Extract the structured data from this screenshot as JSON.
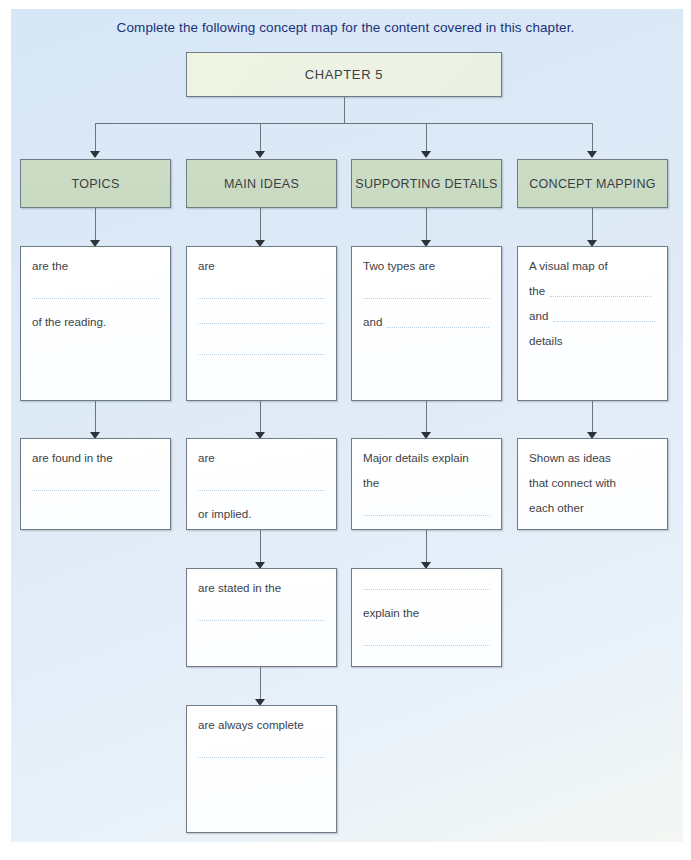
{
  "instruction": "Complete the following concept map for the content covered in this chapter.",
  "root": {
    "label": "CHAPTER 5"
  },
  "colors": {
    "page_background": "#dce9f6",
    "root_box": "#edf2e4",
    "header_box": "#c9dac3",
    "card_box": "#ffffff",
    "border": "#6f7c85",
    "instruction_text": "#20307a",
    "body_text": "#3c4147",
    "dotted_line": "#b9cfe2"
  },
  "columns": [
    {
      "header": "TOPICS",
      "cards": [
        {
          "lines": [
            {
              "type": "text",
              "text": "are the"
            },
            {
              "type": "blank"
            },
            {
              "type": "blank-line"
            },
            {
              "type": "text",
              "text": "of the reading."
            }
          ]
        },
        {
          "lines": [
            {
              "type": "text",
              "text": "are found in the"
            },
            {
              "type": "blank"
            },
            {
              "type": "blank-line"
            }
          ]
        }
      ]
    },
    {
      "header": "MAIN IDEAS",
      "cards": [
        {
          "lines": [
            {
              "type": "text",
              "text": "are"
            },
            {
              "type": "blank"
            },
            {
              "type": "blank-line"
            },
            {
              "type": "blank-line"
            },
            {
              "type": "blank"
            },
            {
              "type": "blank-line"
            }
          ]
        },
        {
          "lines": [
            {
              "type": "text",
              "text": "are"
            },
            {
              "type": "blank"
            },
            {
              "type": "blank-line"
            },
            {
              "type": "text",
              "text": "or implied."
            }
          ]
        },
        {
          "lines": [
            {
              "type": "text",
              "text": "are stated in the"
            },
            {
              "type": "blank"
            },
            {
              "type": "blank-line"
            }
          ]
        },
        {
          "lines": [
            {
              "type": "text",
              "text": "are always complete"
            },
            {
              "type": "blank"
            },
            {
              "type": "blank-line"
            }
          ]
        }
      ]
    },
    {
      "header": "SUPPORTING DETAILS",
      "cards": [
        {
          "lines": [
            {
              "type": "text",
              "text": "Two types are"
            },
            {
              "type": "blank"
            },
            {
              "type": "blank-line"
            },
            {
              "type": "text-dots",
              "text": "and"
            }
          ]
        },
        {
          "lines": [
            {
              "type": "text",
              "text": "Major details explain"
            },
            {
              "type": "text",
              "text": "the"
            },
            {
              "type": "blank"
            },
            {
              "type": "blank-line"
            }
          ]
        },
        {
          "lines": [
            {
              "type": "blank-line"
            },
            {
              "type": "text",
              "text": "explain the"
            },
            {
              "type": "blank"
            },
            {
              "type": "blank-line"
            }
          ]
        }
      ]
    },
    {
      "header": "CONCEPT MAPPING",
      "cards": [
        {
          "lines": [
            {
              "type": "text",
              "text": "A visual map of"
            },
            {
              "type": "text-dots",
              "text": "the"
            },
            {
              "type": "text-dots",
              "text": "and"
            },
            {
              "type": "text",
              "text": "details"
            }
          ]
        },
        {
          "lines": [
            {
              "type": "text",
              "text": "Shown as ideas"
            },
            {
              "type": "text",
              "text": "that connect with"
            },
            {
              "type": "text",
              "text": "each other"
            }
          ]
        }
      ]
    }
  ]
}
